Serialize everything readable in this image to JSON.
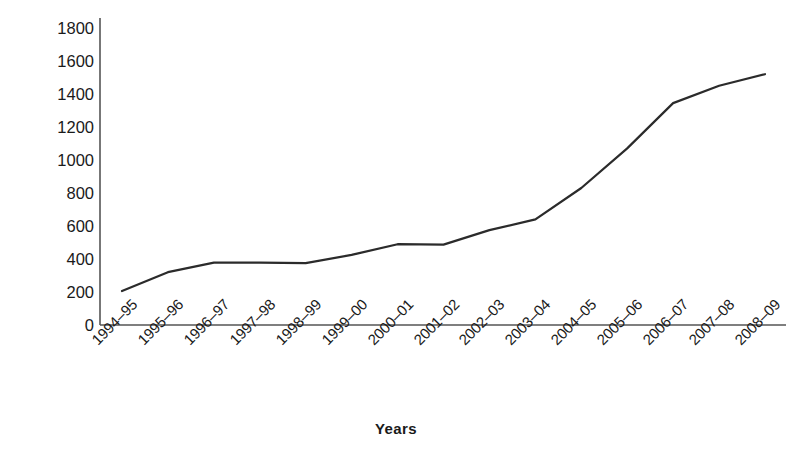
{
  "chart_data": {
    "type": "line",
    "title": "",
    "xlabel": "Years",
    "ylabel": "Rs. million",
    "categories": [
      "1994–95",
      "1995–96",
      "1996–97",
      "1997–98",
      "1998–99",
      "1999–00",
      "2000–01",
      "2001–02",
      "2002–03",
      "2003–04",
      "2004–05",
      "2005–06",
      "2006–07",
      "2007–08",
      "2008–09"
    ],
    "values": [
      206,
      320,
      378,
      378,
      375,
      425,
      490,
      487,
      575,
      640,
      830,
      1070,
      1345,
      1450,
      1520
    ],
    "ylim": [
      0,
      1800
    ],
    "yticks": [
      0,
      200,
      400,
      600,
      800,
      1000,
      1200,
      1400,
      1600,
      1800
    ],
    "ytick_labels": [
      "0",
      "200",
      "400",
      "600",
      "800",
      "1000",
      "1200",
      "1400",
      "1600",
      "1800"
    ],
    "grid": false,
    "legend": false,
    "legend_position": "none",
    "series_color": "#2b2b2b",
    "axis_color": "#555555",
    "background": "#ffffff"
  },
  "axis": {
    "y_title": "Rs. million",
    "x_title": "Years"
  }
}
